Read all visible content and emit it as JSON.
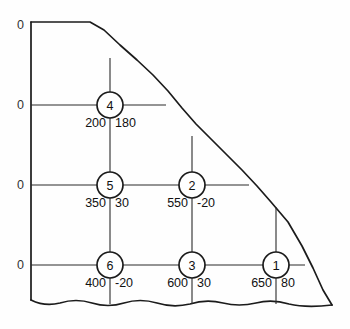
{
  "diagram": {
    "axis_labels": [
      {
        "text": "0",
        "x": 24,
        "y": 25
      },
      {
        "text": "0",
        "x": 24,
        "y": 105
      },
      {
        "text": "0",
        "x": 24,
        "y": 185
      },
      {
        "text": "0",
        "x": 24,
        "y": 265
      }
    ],
    "nodes": [
      {
        "id": "4",
        "label": "4",
        "cx": 110,
        "cy": 105,
        "r": 13,
        "left_value": "200",
        "right_value": "180"
      },
      {
        "id": "5",
        "label": "5",
        "cx": 110,
        "cy": 185,
        "r": 13,
        "left_value": "350",
        "right_value": "30"
      },
      {
        "id": "2",
        "label": "2",
        "cx": 192,
        "cy": 185,
        "r": 13,
        "left_value": "550",
        "right_value": "-20"
      },
      {
        "id": "6",
        "label": "6",
        "cx": 110,
        "cy": 265,
        "r": 13,
        "left_value": "400",
        "right_value": "-20"
      },
      {
        "id": "3",
        "label": "3",
        "cx": 192,
        "cy": 265,
        "r": 13,
        "left_value": "600",
        "right_value": "30"
      },
      {
        "id": "1",
        "label": "1",
        "cx": 276,
        "cy": 265,
        "r": 13,
        "left_value": "650",
        "right_value": "80"
      }
    ],
    "grid": {
      "horizontal_rows": [
        {
          "name": "row-top",
          "y": 105,
          "x1": 31,
          "x2": 166
        },
        {
          "name": "row-middle",
          "y": 185,
          "x1": 31,
          "x2": 249
        },
        {
          "name": "row-bottom",
          "y": 265,
          "x1": 31,
          "x2": 305
        }
      ],
      "vertical_columns": [
        {
          "name": "col-left",
          "x": 110,
          "y1": 58,
          "y2": 305
        },
        {
          "name": "col-center",
          "x": 192,
          "y1": 135,
          "y2": 305
        },
        {
          "name": "col-right",
          "x": 276,
          "y1": 205,
          "y2": 305
        }
      ]
    },
    "boundary": {
      "left_edge": "M31,22 L31,300",
      "top_ridge": "M31,22 L90,22 L105,30 L122,46 L140,62 L158,80 L172,96 L186,113 L200,128 L214,142 L232,158 L248,174 L262,190 L276,206 L292,226 L305,250 L316,272 L326,294 L332,306",
      "bottom_wave": "M31,300 Q46,306 62,303 Q78,299 95,303 Q112,307 128,303 Q145,299 162,303 Q179,307 196,304 Q213,300 230,303 Q247,306 264,303 Q281,300 298,304 Q315,307 332,306"
    },
    "stroke_color": "#1b1b1b",
    "background_color": "#ffffff"
  }
}
